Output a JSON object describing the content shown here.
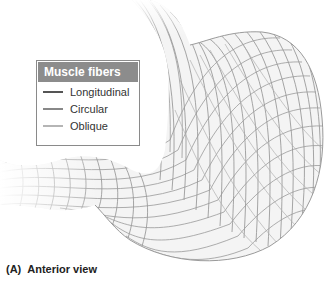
{
  "figure": {
    "colors": {
      "mesh": "#8f8f8f",
      "mesh_light": "#c4c4c4",
      "legend_header_bg": "#8c8c8c",
      "legend_border": "#8a8a8a"
    }
  },
  "legend": {
    "title": "Muscle fibers",
    "items": [
      {
        "label": "Longitudinal",
        "color": "#555555"
      },
      {
        "label": "Circular",
        "color": "#888888"
      },
      {
        "label": "Oblique",
        "color": "#b5b5b5"
      }
    ]
  },
  "caption": {
    "letter": "(A)",
    "text": "Anterior view"
  }
}
